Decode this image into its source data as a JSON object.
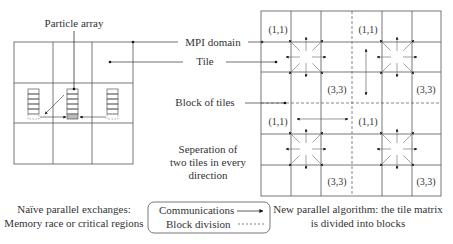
{
  "left_panel": {
    "particle_array_label": "Particle array",
    "caption_line1": "Naïve parallel exchanges:",
    "caption_line2": "Memory race or critical regions"
  },
  "callouts": {
    "mpi_domain": "MPI domain",
    "tile": "Tile",
    "block_of_tiles": "Block of tiles",
    "separation_line1": "Seperation of",
    "separation_line2": "two tiles in every",
    "separation_line3": "direction"
  },
  "right_panel": {
    "tile_labels": {
      "start": "(1,1)",
      "end": "(3,3)"
    },
    "caption_line1": "New parallel algorithm: the tile matrix",
    "caption_line2": "is divided into blocks"
  },
  "legend": {
    "communications": "Communications",
    "block_division": "Block division"
  },
  "colors": {
    "line": "#555555",
    "text": "#333333",
    "shaded_cell": "#bbbbbb"
  }
}
